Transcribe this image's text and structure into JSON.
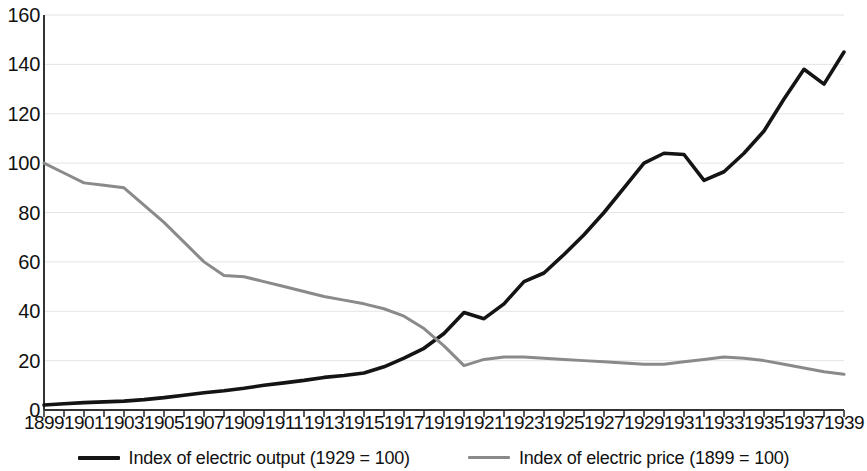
{
  "chart_data": {
    "type": "line",
    "title": "",
    "xlabel": "",
    "ylabel": "",
    "xlim": [
      1899,
      1939
    ],
    "ylim": [
      0,
      160
    ],
    "grid": true,
    "legend_position": "bottom",
    "y_ticks": [
      0,
      20,
      40,
      60,
      80,
      100,
      120,
      140,
      160
    ],
    "x_tick_labels": [
      1899,
      1901,
      1903,
      1905,
      1907,
      1909,
      1911,
      1913,
      1915,
      1917,
      1919,
      1921,
      1923,
      1925,
      1927,
      1929,
      1931,
      1933,
      1935,
      1937,
      1939
    ],
    "x": [
      1899,
      1900,
      1901,
      1902,
      1903,
      1904,
      1905,
      1906,
      1907,
      1908,
      1909,
      1910,
      1911,
      1912,
      1913,
      1914,
      1915,
      1916,
      1917,
      1918,
      1919,
      1920,
      1921,
      1922,
      1923,
      1924,
      1925,
      1926,
      1927,
      1928,
      1929,
      1930,
      1931,
      1932,
      1933,
      1934,
      1935,
      1936,
      1937,
      1938,
      1939
    ],
    "series": [
      {
        "name": "Index of electric output (1929 = 100)",
        "color": "#141414",
        "width": 3.6,
        "values": [
          2,
          2.5,
          3,
          3.3,
          3.6,
          4.2,
          5,
          6,
          7,
          7.8,
          8.8,
          10,
          11,
          12,
          13.2,
          14,
          15,
          17.5,
          21,
          25,
          31,
          39.5,
          37,
          43,
          52,
          55.5,
          63,
          71,
          80,
          90,
          100,
          104,
          103.5,
          93,
          96.5,
          104,
          113,
          126,
          138,
          132,
          145
        ]
      },
      {
        "name": "Index of electric price (1899 = 100)",
        "color": "#8a8a8a",
        "width": 3.0,
        "values": [
          100,
          96,
          92,
          91,
          90,
          83,
          76,
          68,
          60,
          54.5,
          54,
          52,
          50,
          48,
          46,
          44.5,
          43,
          41,
          38,
          33,
          26,
          18,
          20.5,
          21.5,
          21.5,
          21,
          20.5,
          20,
          19.5,
          19,
          18.5,
          18.5,
          19.5,
          20.5,
          21.5,
          21,
          20,
          18.5,
          17,
          15.5,
          14.5
        ]
      }
    ]
  },
  "legend": {
    "items": [
      {
        "label": "Index of electric output (1929 = 100)",
        "color": "#141414",
        "style": "thick"
      },
      {
        "label": "Index of electric price (1899 = 100)",
        "color": "#8a8a8a",
        "style": "thin"
      }
    ]
  }
}
